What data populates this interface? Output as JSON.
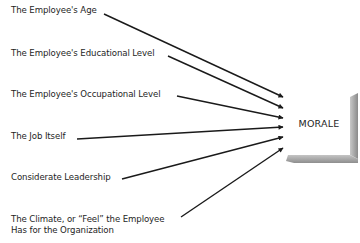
{
  "diagram": {
    "target": {
      "label": "MORALE"
    },
    "factors": [
      {
        "label": "The Employee's Age"
      },
      {
        "label": "The Employee's Educational Level"
      },
      {
        "label": "The Employee's Occupational Level"
      },
      {
        "label": "The Job Itself"
      },
      {
        "label": "Considerate Leadership"
      },
      {
        "label_line1": "The Climate, or “Feel” the Employee",
        "label_line2": "Has for the Organization"
      }
    ],
    "colors": {
      "arrow": "#1a1a1a",
      "box_shadow": "#9a9a9a",
      "text": "#1e1e1e"
    }
  }
}
